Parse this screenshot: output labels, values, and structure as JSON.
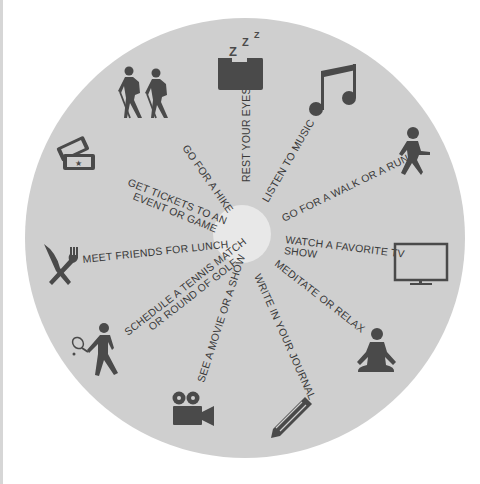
{
  "wheel": {
    "background_color": "#ffffff",
    "disc_color": "#cfcfcf",
    "hub_color": "#e8e8e8",
    "text_color": "#3a3a3a",
    "icon_color": "#4a4a4a",
    "activities": [
      {
        "label": "REST YOUR EYES",
        "icon": "sleeping-pillow-icon"
      },
      {
        "label": "LISTEN TO MUSIC",
        "icon": "music-note-icon"
      },
      {
        "label": "GO FOR A WALK OR A RUN",
        "icon": "walking-person-icon"
      },
      {
        "label_line1": "WATCH A FAVORITE TV",
        "label_line2": "SHOW",
        "icon": "tv-icon"
      },
      {
        "label": "MEDITATE OR RELAX",
        "icon": "meditation-icon"
      },
      {
        "label": "WRITE IN YOUR JOURNAL",
        "icon": "pencil-icon"
      },
      {
        "label": "SEE A MOVIE OR A SHOW",
        "icon": "movie-camera-icon"
      },
      {
        "label_line1": "SCHEDULE A TENNIS MATCH",
        "label_line2": "OR ROUND OF GOLF",
        "icon": "tennis-player-icon"
      },
      {
        "label": "MEET FRIENDS FOR LUNCH",
        "icon": "knife-fork-icon"
      },
      {
        "label_line1": "GET TICKETS TO AN",
        "label_line2": "EVENT OR GAME",
        "icon": "tickets-icon"
      },
      {
        "label": "GO FOR A HIKE",
        "icon": "hikers-icon"
      }
    ],
    "sleep_glyph": "z z z"
  }
}
